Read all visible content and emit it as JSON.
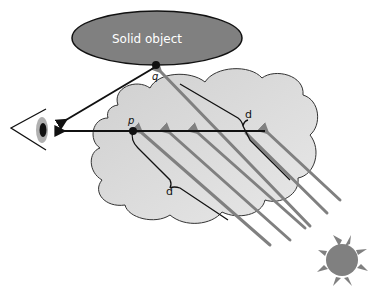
{
  "diagram": {
    "solid_object": {
      "label": "Solid object",
      "fill": "#808080",
      "text_color": "#ffffff"
    },
    "points": {
      "q": {
        "label": "q"
      },
      "p": {
        "label": "p"
      }
    },
    "distances": {
      "d_upper": {
        "label": "d"
      },
      "d_lower": {
        "label": "d"
      }
    },
    "colors": {
      "cloud_fill": "#d8d8d8",
      "ray_color": "#808080",
      "sight_line": "#111111",
      "sun_fill": "#808080"
    },
    "elements": [
      "eye",
      "solid object",
      "cloud",
      "sun",
      "light rays",
      "sight lines"
    ]
  }
}
